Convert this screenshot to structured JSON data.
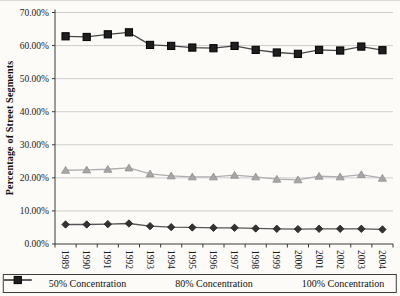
{
  "figure": {
    "background": "#fcfbf8"
  },
  "chart_data": {
    "type": "line",
    "title": "",
    "xlabel": "",
    "ylabel": "Percentage of Street Segments",
    "ylim": [
      0,
      70
    ],
    "ytick_step": 10,
    "yticks": [
      "70.00%",
      "60.00%",
      "50.00%",
      "40.00%",
      "30.00%",
      "20.00%",
      "10.00%",
      "0.00%"
    ],
    "grid": true,
    "legend_position": "bottom",
    "categories": [
      "1989",
      "1990",
      "1991",
      "1992",
      "1993",
      "1994",
      "1995",
      "1996",
      "1997",
      "1998",
      "1999",
      "2000",
      "2001",
      "2002",
      "2003",
      "2004"
    ],
    "series": [
      {
        "name": "50% Concentration",
        "marker": "diamond",
        "line_color": "#555555",
        "fill": "#333333",
        "edge": "#1a1a1a",
        "values": [
          5.9,
          5.9,
          6.0,
          6.2,
          5.4,
          5.1,
          5.0,
          4.9,
          4.9,
          4.7,
          4.6,
          4.5,
          4.6,
          4.6,
          4.6,
          4.4
        ]
      },
      {
        "name": "80% Concentration",
        "marker": "triangle",
        "line_color": "#aeaeae",
        "fill": "#a6a6a6",
        "edge": "#8f8f8f",
        "values": [
          22.3,
          22.4,
          22.6,
          23.0,
          21.2,
          20.6,
          20.3,
          20.3,
          20.8,
          20.3,
          19.6,
          19.4,
          20.5,
          20.3,
          21.0,
          19.9
        ]
      },
      {
        "name": "100% Concentration",
        "marker": "square",
        "line_color": "#474747",
        "fill": "#1f1f1f",
        "edge": "#000000",
        "values": [
          62.8,
          62.6,
          63.4,
          64.0,
          60.2,
          59.9,
          59.4,
          59.2,
          59.9,
          58.7,
          57.9,
          57.5,
          58.7,
          58.5,
          59.7,
          58.6
        ]
      }
    ]
  }
}
